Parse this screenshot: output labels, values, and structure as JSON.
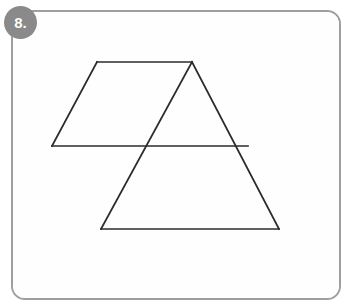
{
  "card": {
    "badge_label": "8.",
    "border_color": "#9e9e9e",
    "background_color": "#ffffff",
    "badge_color": "#8a8a8a",
    "badge_text_color": "#ffffff"
  },
  "figure": {
    "name": "overlapping-parallelogram-and-triangle",
    "stroke_color": "#2b2b2b",
    "stroke_width": 1.7,
    "vertices": {
      "top_left": [
        97,
        62
      ],
      "top_right_apex": [
        192,
        62
      ],
      "mid_left": [
        52,
        146
      ],
      "mid_cross": [
        145,
        146
      ],
      "mid_right": [
        248,
        146
      ],
      "bottom_left": [
        101,
        229
      ],
      "bottom_right": [
        279,
        229
      ]
    },
    "segments": [
      {
        "name": "top-edge",
        "from": [
          97,
          62
        ],
        "to": [
          192,
          62
        ]
      },
      {
        "name": "left-slant-upper",
        "from": [
          97,
          62
        ],
        "to": [
          52,
          146
        ]
      },
      {
        "name": "middle-horizontal",
        "from": [
          52,
          146
        ],
        "to": [
          248,
          146
        ]
      },
      {
        "name": "long-diagonal-apex-to-bottom-left",
        "from": [
          192,
          62
        ],
        "to": [
          101,
          229
        ]
      },
      {
        "name": "right-slant-apex-to-bottom-right",
        "from": [
          192,
          62
        ],
        "to": [
          279,
          229
        ]
      },
      {
        "name": "bottom-edge",
        "from": [
          101,
          229
        ],
        "to": [
          279,
          229
        ]
      }
    ],
    "shapes": [
      {
        "name": "upper-parallelogram",
        "points": "97,62 192,62 145,146 52,146"
      },
      {
        "name": "large-triangle",
        "points": "192,62 279,229 101,229"
      },
      {
        "name": "right-trapezoid-upper",
        "points": "145,146 192,62 248,146"
      }
    ]
  }
}
